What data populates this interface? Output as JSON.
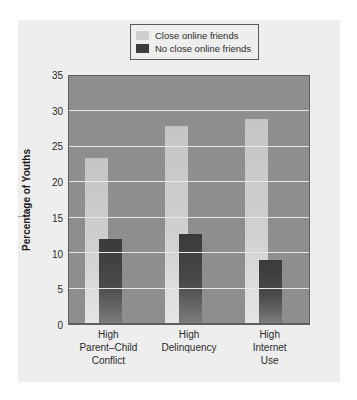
{
  "legend": {
    "items": [
      {
        "label": "Close online friends",
        "color": "#cfcfcf",
        "name": "close-online-friends"
      },
      {
        "label": "No close online friends",
        "color": "#3d3d3d",
        "name": "no-close-online-friends"
      }
    ]
  },
  "axis": {
    "ylabel": "Percentage of Youths",
    "yticks": [
      "0",
      "5",
      "10",
      "15",
      "20",
      "25",
      "30",
      "35"
    ]
  },
  "chart_data": {
    "type": "bar",
    "title": "",
    "xlabel": "",
    "ylabel": "Percentage of Youths",
    "ylim": [
      0,
      35
    ],
    "ytick_step": 5,
    "grid": true,
    "legend_position": "top-center",
    "categories": [
      "High Parent–Child Conflict",
      "High Delinquency",
      "High Internet Use"
    ],
    "category_lines": [
      [
        "High",
        "Parent–Child",
        "Conflict"
      ],
      [
        "High",
        "Delinquency"
      ],
      [
        "High",
        "Internet",
        "Use"
      ]
    ],
    "series": [
      {
        "name": "Close online friends",
        "color": "#cfcfcf",
        "values": [
          23.5,
          28,
          29
        ]
      },
      {
        "name": "No close online friends",
        "color": "#3d3d3d",
        "values": [
          12,
          12.7,
          9
        ]
      }
    ]
  }
}
